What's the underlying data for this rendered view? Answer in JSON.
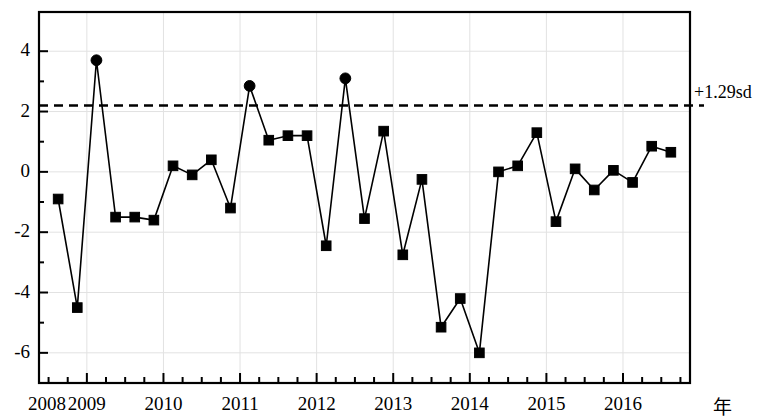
{
  "chart_data": {
    "type": "line",
    "title": "",
    "subtitle": "",
    "xlabel": "年",
    "ylabel": "",
    "xlim": [
      2008.375,
      2016.875
    ],
    "ylim": [
      -7.0,
      5.3
    ],
    "y_ticks": [
      4,
      2,
      0,
      -2,
      -4,
      -6
    ],
    "y_tick_labels": [
      "4",
      "2",
      "0",
      "-2",
      "-4",
      "-6"
    ],
    "y_minor_step": 1,
    "x_ticks": [
      2008,
      2009,
      2010,
      2011,
      2012,
      2013,
      2014,
      2015,
      2016
    ],
    "x_tick_labels": [
      "2008",
      "2009",
      "2010",
      "2011",
      "2012",
      "2013",
      "2014",
      "2015",
      "2016"
    ],
    "x_minor_step": 0.25,
    "grid": true,
    "grid_color": "#e2e2e2",
    "axis_color": "#000000",
    "line_color": "#000000",
    "marker_color": "#000000",
    "legend_position": "none",
    "threshold": {
      "value": 2.2,
      "label": "+1.29sd",
      "style": "dashed",
      "color": "#000000"
    },
    "series": [
      {
        "name": "指数",
        "x": [
          2008.625,
          2008.875,
          2009.125,
          2009.375,
          2009.625,
          2009.875,
          2010.125,
          2010.375,
          2010.625,
          2010.875,
          2011.125,
          2011.375,
          2011.625,
          2011.875,
          2012.125,
          2012.375,
          2012.625,
          2012.875,
          2013.125,
          2013.375,
          2013.625,
          2013.875,
          2014.125,
          2014.375,
          2014.625,
          2014.875,
          2015.125,
          2015.375,
          2015.625,
          2015.875,
          2016.125,
          2016.375,
          2016.625
        ],
        "x_labels": [
          "2008Q3",
          "2008Q4",
          "2009Q1",
          "2009Q2",
          "2009Q3",
          "2009Q4",
          "2010Q1",
          "2010Q2",
          "2010Q3",
          "2010Q4",
          "2011Q1",
          "2011Q2",
          "2011Q3",
          "2011Q4",
          "2012Q1",
          "2012Q2",
          "2012Q3",
          "2012Q4",
          "2013Q1",
          "2013Q2",
          "2013Q3",
          "2013Q4",
          "2014Q1",
          "2014Q2",
          "2014Q3",
          "2014Q4",
          "2015Q1",
          "2015Q2",
          "2015Q3",
          "2015Q4",
          "2016Q1",
          "2016Q2",
          "2016Q3"
        ],
        "values": [
          -0.9,
          -4.5,
          3.7,
          -1.5,
          -1.5,
          -1.6,
          0.2,
          -0.1,
          0.4,
          -1.2,
          2.85,
          1.05,
          1.2,
          1.2,
          -2.45,
          3.1,
          -1.55,
          1.35,
          -2.75,
          -0.25,
          -5.15,
          -4.2,
          -6.0,
          0.0,
          0.2,
          1.3,
          -1.65,
          0.1,
          -0.6,
          0.05,
          -0.35,
          0.85,
          0.65
        ],
        "marker_shapes": [
          "square",
          "square",
          "circle",
          "square",
          "square",
          "square",
          "square",
          "square",
          "square",
          "square",
          "circle",
          "square",
          "square",
          "square",
          "square",
          "circle",
          "square",
          "square",
          "square",
          "square",
          "square",
          "square",
          "square",
          "square",
          "square",
          "square",
          "square",
          "square",
          "square",
          "square",
          "square",
          "square",
          "square"
        ]
      }
    ]
  }
}
